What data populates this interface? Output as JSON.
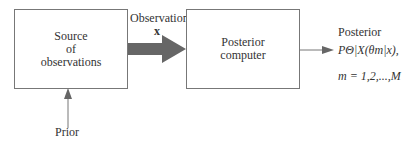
{
  "diagram": {
    "source_box": {
      "line1": "Source",
      "line2": "of",
      "line3": "observations"
    },
    "observation_label": {
      "title": "Observation",
      "symbol": "x"
    },
    "posterior_box": {
      "line1": "Posterior",
      "line2": "computer"
    },
    "output": {
      "title": "Posterior",
      "formula": "PΘ|X(θm|x),",
      "index": "m = 1,2,...,M"
    },
    "prior_label": "Prior",
    "colors": {
      "box_border": "#777777",
      "arrow": "#666666",
      "text": "#333333"
    }
  }
}
